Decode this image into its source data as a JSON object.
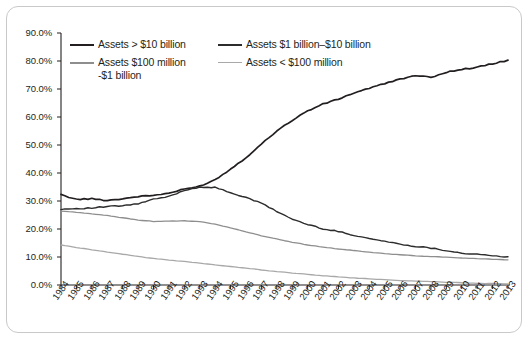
{
  "chart_data": {
    "type": "line",
    "title": "",
    "xlabel": "",
    "ylabel": "",
    "grid": false,
    "legend_position": "top-left-inside",
    "ylim": [
      0,
      90
    ],
    "ytick_labels": [
      "0.0%",
      "10.0%",
      "20.0%",
      "30.0%",
      "40.0%",
      "50.0%",
      "60.0%",
      "70.0%",
      "80.0%",
      "90.0%"
    ],
    "ytick_values": [
      0,
      10,
      20,
      30,
      40,
      50,
      60,
      70,
      80,
      90
    ],
    "x": [
      1984,
      1985,
      1986,
      1987,
      1988,
      1989,
      1990,
      1991,
      1992,
      1993,
      1994,
      1995,
      1996,
      1997,
      1998,
      1999,
      2000,
      2001,
      2002,
      2003,
      2004,
      2005,
      2006,
      2007,
      2008,
      2009,
      2010,
      2011,
      2012,
      2013
    ],
    "xtick_labels": [
      "1984",
      "1985",
      "1986",
      "1987",
      "1988",
      "1989",
      "1990",
      "1991",
      "1992",
      "1993",
      "1994",
      "1995",
      "1996",
      "1997",
      "1998",
      "1999",
      "2000",
      "2001",
      "2002",
      "2003",
      "2004",
      "2005",
      "2006",
      "2007",
      "2008",
      "2009",
      "2010",
      "2011",
      "2012",
      "2013"
    ],
    "series": [
      {
        "name": "Assets > $10 billion",
        "color": "#231f20",
        "width": 1.7,
        "values": [
          32.2,
          30.6,
          30.8,
          30.2,
          30.8,
          31.6,
          32.0,
          32.8,
          34.2,
          35.3,
          37.6,
          41.4,
          45.5,
          50.3,
          55.1,
          58.8,
          62.2,
          64.6,
          66.4,
          68.6,
          70.3,
          71.9,
          73.6,
          74.7,
          74.2,
          76.0,
          77.0,
          77.8,
          79.0,
          80.3
        ]
      },
      {
        "name": "Assets $1 billion-$10 billion",
        "color": "#2c2c2c",
        "width": 1.4,
        "values": [
          27.1,
          27.3,
          27.5,
          28.0,
          28.3,
          29.0,
          30.6,
          31.6,
          33.8,
          35.0,
          34.8,
          33.0,
          31.2,
          29.2,
          26.3,
          23.5,
          21.6,
          20.1,
          19.1,
          17.8,
          16.6,
          15.6,
          14.6,
          13.8,
          13.2,
          12.3,
          11.4,
          10.9,
          10.4,
          10.1
        ]
      },
      {
        "name": "Assets $100 million-$1 billion",
        "color": "#8e8e8e",
        "width": 1.3,
        "values": [
          26.4,
          26.0,
          25.4,
          24.8,
          24.0,
          23.2,
          22.7,
          22.8,
          22.9,
          22.6,
          21.7,
          20.4,
          19.0,
          17.6,
          16.4,
          15.3,
          14.3,
          13.5,
          12.9,
          12.3,
          11.7,
          11.2,
          10.8,
          10.4,
          10.2,
          9.9,
          9.6,
          9.4,
          9.2,
          9.0
        ]
      },
      {
        "name": "Assets < $100 million",
        "color": "#a8a8a8",
        "width": 1.3,
        "values": [
          14.3,
          13.4,
          12.6,
          11.8,
          11.0,
          10.2,
          9.5,
          8.9,
          8.4,
          7.8,
          7.2,
          6.6,
          6.0,
          5.4,
          4.8,
          4.3,
          3.8,
          3.3,
          2.9,
          2.5,
          2.2,
          1.9,
          1.6,
          1.4,
          1.2,
          1.0,
          0.8,
          0.6,
          0.5,
          0.4
        ]
      }
    ],
    "legend": [
      {
        "label": "Assets > $10 billion",
        "color": "#231f20"
      },
      {
        "label": "Assets $1 billion–$10 billion",
        "color": "#2c2c2c"
      },
      {
        "label": "Assets $100 million\n-$1 billion",
        "color": "#8e8e8e"
      },
      {
        "label": "Assets < $100 million",
        "color": "#a8a8a8"
      }
    ],
    "legend_labels": {
      "l1": "Assets > $10 billion",
      "l2": "Assets $1 billion–$10 billion",
      "l3_line1": "Assets $100 million",
      "l3_line2": "-$1 billion",
      "l4": "Assets < $100 million"
    }
  }
}
